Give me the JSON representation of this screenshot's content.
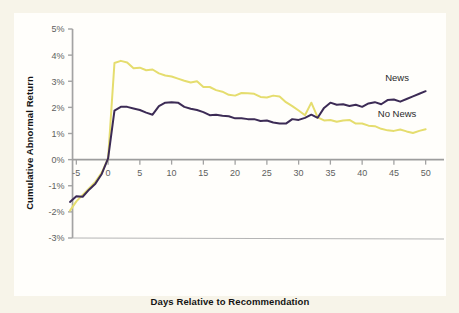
{
  "figure": {
    "background_color": "#f7f4e9",
    "panel_color": "#fffefb"
  },
  "chart_data": {
    "type": "line",
    "title": "",
    "subtitle": "",
    "xlabel": "Days Relative to Recommendation",
    "ylabel": "Cumulative Abnormal Return",
    "xlim": [
      -6,
      51
    ],
    "ylim": [
      -3,
      5
    ],
    "xticks": [
      -5,
      0,
      5,
      10,
      15,
      20,
      25,
      30,
      35,
      40,
      45,
      50
    ],
    "xtick_labels": [
      "-5",
      "0",
      "5",
      "10",
      "15",
      "20",
      "25",
      "30",
      "35",
      "40",
      "45",
      "50"
    ],
    "yticks": [
      -3,
      -2,
      -1,
      0,
      1,
      2,
      3,
      4,
      5
    ],
    "ytick_labels": [
      "-3%",
      "-2%",
      "-1%",
      "0%",
      "1%",
      "2%",
      "3%",
      "4%",
      "5%"
    ],
    "grid": false,
    "legend_position": "inline-right-annotations",
    "y_unit": "percent",
    "zero_line": true,
    "annotations": [
      {
        "text": "News",
        "x": 45.5,
        "y": 3.0,
        "color": "#3c2b55"
      },
      {
        "text": "No News",
        "x": 45.5,
        "y": 1.65,
        "color": "#3c2b55"
      }
    ],
    "series": [
      {
        "name": "News",
        "color": "#e5dd6e",
        "width": 2.0,
        "x": [
          -6,
          -5,
          -4,
          -3,
          -2,
          -1,
          0,
          1,
          2,
          3,
          4,
          5,
          6,
          7,
          8,
          9,
          10,
          11,
          12,
          13,
          14,
          15,
          16,
          17,
          18,
          19,
          20,
          21,
          22,
          23,
          24,
          25,
          26,
          27,
          28,
          29,
          30,
          31,
          32,
          33,
          34,
          35,
          36,
          37,
          38,
          39,
          40,
          41,
          42,
          43,
          44,
          45,
          46,
          47,
          48,
          49,
          50
        ],
        "values": [
          -1.95,
          -1.6,
          -1.35,
          -1.1,
          -0.85,
          -0.5,
          0.05,
          3.7,
          3.78,
          3.72,
          3.5,
          3.52,
          3.42,
          3.45,
          3.3,
          3.22,
          3.18,
          3.1,
          3.02,
          2.95,
          3.0,
          2.78,
          2.78,
          2.66,
          2.6,
          2.48,
          2.45,
          2.55,
          2.54,
          2.52,
          2.4,
          2.38,
          2.45,
          2.42,
          2.2,
          2.05,
          1.88,
          1.7,
          2.18,
          1.62,
          1.5,
          1.52,
          1.45,
          1.5,
          1.52,
          1.38,
          1.38,
          1.3,
          1.28,
          1.18,
          1.12,
          1.1,
          1.15,
          1.08,
          1.02,
          1.1,
          1.16
        ]
      },
      {
        "name": "No News",
        "color": "#3c2b55",
        "width": 2.0,
        "x": [
          -6,
          -5,
          -4,
          -3,
          -2,
          -1,
          0,
          1,
          2,
          3,
          4,
          5,
          6,
          7,
          8,
          9,
          10,
          11,
          12,
          13,
          14,
          15,
          16,
          17,
          18,
          19,
          20,
          21,
          22,
          23,
          24,
          25,
          26,
          27,
          28,
          29,
          30,
          31,
          32,
          33,
          34,
          35,
          36,
          37,
          38,
          39,
          40,
          41,
          42,
          43,
          44,
          45,
          46,
          47,
          48,
          49,
          50
        ],
        "values": [
          -1.62,
          -1.4,
          -1.42,
          -1.15,
          -0.92,
          -0.55,
          0.05,
          1.88,
          2.02,
          2.02,
          1.96,
          1.9,
          1.8,
          1.72,
          2.05,
          2.18,
          2.2,
          2.18,
          2.02,
          1.95,
          1.9,
          1.82,
          1.7,
          1.72,
          1.68,
          1.66,
          1.58,
          1.58,
          1.55,
          1.55,
          1.48,
          1.5,
          1.42,
          1.38,
          1.38,
          1.55,
          1.52,
          1.6,
          1.72,
          1.6,
          1.98,
          2.18,
          2.1,
          2.12,
          2.05,
          2.1,
          2.02,
          2.15,
          2.2,
          2.12,
          2.28,
          2.3,
          2.22,
          2.32,
          2.42,
          2.52,
          2.62
        ]
      }
    ]
  }
}
